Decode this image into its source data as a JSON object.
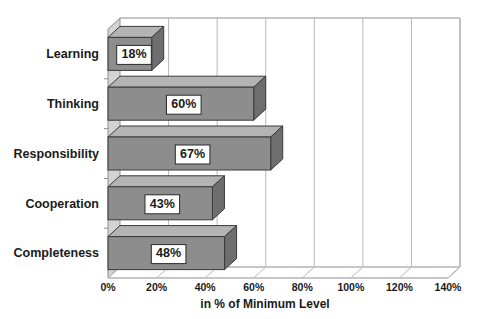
{
  "chart_data": {
    "type": "bar",
    "orientation": "horizontal",
    "style": "3d",
    "title": "",
    "subtitle": "",
    "xlabel": "in % of Minimum Level",
    "ylabel": "",
    "categories": [
      "Learning",
      "Thinking",
      "Responsibility",
      "Cooperation",
      "Completeness"
    ],
    "values": [
      18,
      60,
      67,
      43,
      48
    ],
    "value_labels": [
      "18%",
      "60%",
      "67%",
      "43%",
      "48%"
    ],
    "xlim": [
      0,
      140
    ],
    "xticks": [
      0,
      20,
      40,
      60,
      80,
      100,
      120,
      140
    ],
    "xtick_labels": [
      "0%",
      "20%",
      "40%",
      "60%",
      "80%",
      "100%",
      "120%",
      "140%"
    ],
    "grid": true,
    "grid_axis": "x",
    "legend": false,
    "legend_position": "none",
    "series": [
      {
        "name": "",
        "values": [
          18,
          60,
          67,
          43,
          48
        ]
      }
    ],
    "bar_color": "#8d8d8d",
    "bar_top_color": "#b4b4b4",
    "bar_cap_color": "#6e6e6e",
    "background_color": "#ffffff",
    "grid_color": "#b9b9b9",
    "text_color": "#1a1a1a"
  },
  "axis": {
    "x_title": "in % of Minimum Level"
  }
}
